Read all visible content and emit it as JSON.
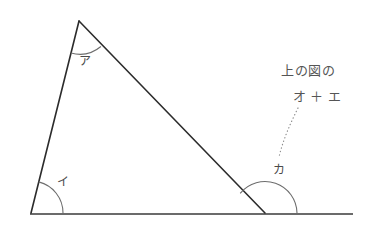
{
  "figure": {
    "type": "geometry-diagram",
    "background_color": "#ffffff",
    "line_color": "#2b2b2b",
    "arc_color": "#6d6d6d",
    "text_color": "#555555",
    "width": 379,
    "height": 237
  },
  "geometry": {
    "vertices": {
      "apex": {
        "name": "apex-vertex",
        "x": 79,
        "y": 21
      },
      "bottom_left": {
        "name": "bottom-left-vertex",
        "x": 31,
        "y": 213
      },
      "bottom_right": {
        "name": "bottom-right-vertex",
        "x": 265,
        "y": 213
      }
    },
    "baseline": {
      "x1": 30,
      "y1": 214,
      "x2": 353,
      "y2": 214
    },
    "sides": [
      {
        "name": "left-side",
        "x1": 79,
        "y1": 21,
        "x2": 31,
        "y2": 213
      },
      {
        "name": "hypotenuse",
        "x1": 79,
        "y1": 21,
        "x2": 265,
        "y2": 213
      },
      {
        "name": "base-segment",
        "x1": 31,
        "y1": 213,
        "x2": 265,
        "y2": 213
      }
    ],
    "arcs": [
      {
        "name": "arc-apex",
        "cx": 79,
        "cy": 21,
        "r": 33
      },
      {
        "name": "arc-bottom-left",
        "cx": 31,
        "cy": 213,
        "r": 32
      },
      {
        "name": "arc-exterior",
        "cx": 265,
        "cy": 213,
        "r": 32
      }
    ]
  },
  "labels": {
    "apex_angle": {
      "text": "ア",
      "x": 79,
      "y": 55
    },
    "base_angle": {
      "text": "イ",
      "x": 57,
      "y": 176
    },
    "exterior_angle": {
      "text": "カ",
      "x": 273,
      "y": 164
    }
  },
  "annotation": {
    "line1": "上の図の",
    "line2": "オ ＋ エ",
    "x": 281,
    "y": 60
  }
}
